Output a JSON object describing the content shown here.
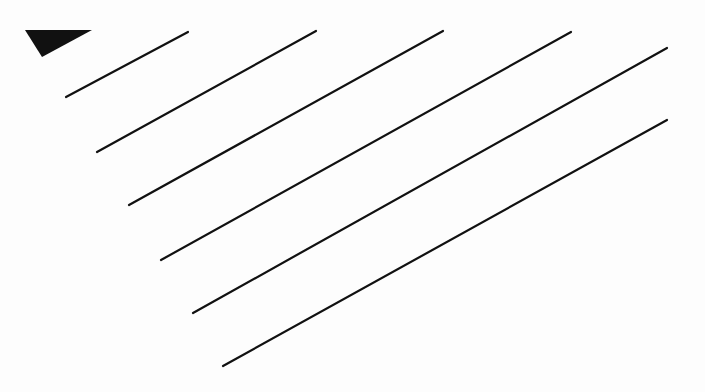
{
  "canvas": {
    "width": 705,
    "height": 392,
    "background": "#fdfdfd"
  },
  "colors": {
    "ink": "#111111"
  },
  "triangle": {
    "points": [
      [
        25,
        30
      ],
      [
        92,
        30
      ],
      [
        42,
        57
      ]
    ]
  },
  "lines": [
    {
      "x1": 66,
      "y1": 97,
      "x2": 188,
      "y2": 32
    },
    {
      "x1": 97,
      "y1": 152,
      "x2": 316,
      "y2": 31
    },
    {
      "x1": 129,
      "y1": 205,
      "x2": 443,
      "y2": 31
    },
    {
      "x1": 161,
      "y1": 260,
      "x2": 571,
      "y2": 32
    },
    {
      "x1": 193,
      "y1": 313,
      "x2": 667,
      "y2": 48
    },
    {
      "x1": 223,
      "y1": 366,
      "x2": 667,
      "y2": 120
    }
  ],
  "stroke_width": 2.2
}
